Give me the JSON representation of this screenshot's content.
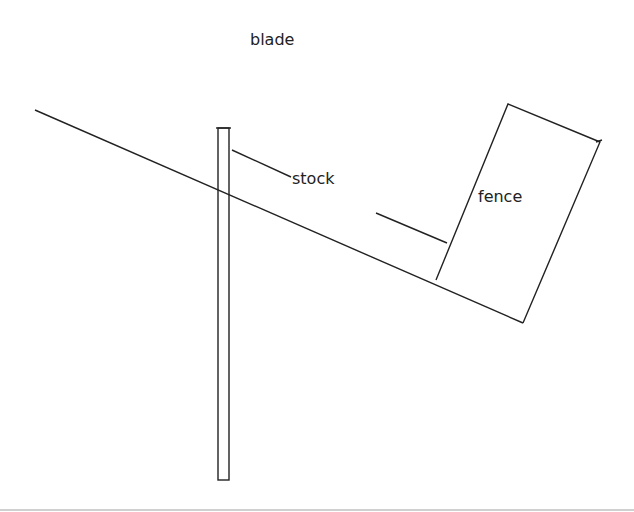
{
  "diagram": {
    "labels": {
      "blade": "blade",
      "stock": "stock",
      "fence": "fence"
    },
    "colors": {
      "line": "#222222",
      "background": "#ffffff",
      "bottom_rule": "#c8c8c8"
    }
  }
}
